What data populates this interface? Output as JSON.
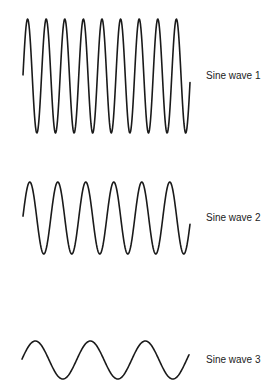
{
  "waves": [
    {
      "label": "Sine wave 1",
      "x_start": 23,
      "x_end": 190,
      "center_y": 76,
      "amplitude": 57,
      "period": 18.6,
      "phase_start": 0.02,
      "cycles_visible": 9,
      "label_pos": {
        "x": 206,
        "y": 70
      }
    },
    {
      "label": "Sine wave 2",
      "x_start": 23,
      "x_end": 190,
      "center_y": 218,
      "amplitude": 36,
      "period": 28,
      "phase_start": 0.05,
      "cycles_visible": 6,
      "label_pos": {
        "x": 206,
        "y": 212
      }
    },
    {
      "label": "Sine wave 3",
      "x_start": 22,
      "x_end": 189,
      "center_y": 360,
      "amplitude": 19,
      "period": 55,
      "phase_start": 0.05,
      "cycles_visible": 3,
      "label_pos": {
        "x": 206,
        "y": 354
      }
    }
  ],
  "colors": {
    "stroke": "#1a1a1a",
    "text": "#222222",
    "background": "#ffffff"
  }
}
